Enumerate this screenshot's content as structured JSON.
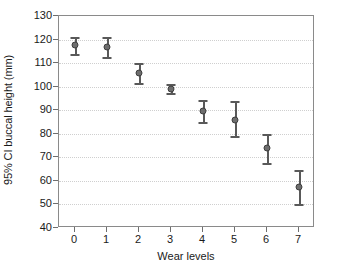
{
  "chart_data": {
    "type": "scatter",
    "title": "",
    "xlabel": "Wear levels",
    "ylabel": "95% CI buccal height (mm)",
    "categories": [
      "0",
      "1",
      "2",
      "3",
      "4",
      "5",
      "6",
      "7"
    ],
    "x": [
      0,
      1,
      2,
      3,
      4,
      5,
      6,
      7
    ],
    "values": [
      117.5,
      117.0,
      106.0,
      99.2,
      89.5,
      86.0,
      73.8,
      57.5
    ],
    "error_low": [
      114.0,
      112.5,
      101.5,
      97.5,
      85.0,
      79.0,
      67.5,
      50.0
    ],
    "error_high": [
      121.0,
      121.0,
      110.0,
      101.0,
      94.5,
      94.0,
      80.0,
      64.5
    ],
    "xlim": [
      -0.5,
      7.5
    ],
    "ylim": [
      40,
      130
    ],
    "yticks": [
      40,
      50,
      60,
      70,
      80,
      90,
      100,
      110,
      120,
      130
    ],
    "ytick_labels": [
      "40",
      "50",
      "60",
      "70",
      "80",
      "90",
      "100",
      "110",
      "120",
      "130"
    ],
    "xticks": [
      0,
      1,
      2,
      3,
      4,
      5,
      6,
      7
    ],
    "xtick_labels": [
      "0",
      "1",
      "2",
      "3",
      "4",
      "5",
      "6",
      "7"
    ],
    "grid": true,
    "grid_axis": "y",
    "legend": false,
    "marker_color": "#6e6e6e",
    "error_color": "#595959",
    "grid_color": "#cfcfcf",
    "frame_color": "#8a8a8a",
    "background": "#ffffff"
  }
}
